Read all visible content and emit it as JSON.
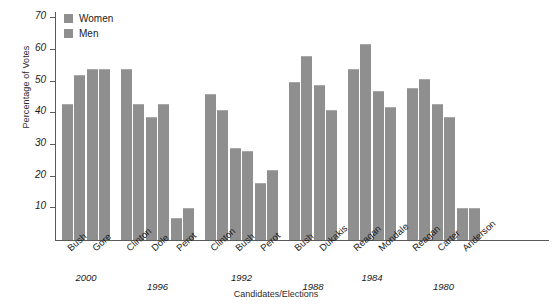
{
  "chart_data": {
    "type": "bar",
    "title": "",
    "xlabel": "Candidates/Elections",
    "ylabel": "Percentage of Votes",
    "ylim": [
      0,
      72
    ],
    "yticks": [
      10,
      20,
      30,
      40,
      50,
      60,
      70
    ],
    "grid": false,
    "legend_position": "top-left",
    "categories": [
      "Bush",
      "Gore",
      "Clinton",
      "Dole",
      "Perot",
      "Clinton",
      "Bush",
      "Perot",
      "Bush",
      "Dukakis",
      "Reagan",
      "Mondale",
      "Reagan",
      "Carter",
      "Anderson"
    ],
    "groups": [
      {
        "year": "2000",
        "candidates": [
          "Bush",
          "Gore"
        ]
      },
      {
        "year": "1996",
        "candidates": [
          "Clinton",
          "Dole",
          "Perot"
        ]
      },
      {
        "year": "1992",
        "candidates": [
          "Clinton",
          "Bush",
          "Perot"
        ]
      },
      {
        "year": "1988",
        "candidates": [
          "Bush",
          "Dukakis"
        ]
      },
      {
        "year": "1984",
        "candidates": [
          "Reagan",
          "Mondale"
        ]
      },
      {
        "year": "1980",
        "candidates": [
          "Reagan",
          "Carter",
          "Anderson"
        ]
      }
    ],
    "series": [
      {
        "name": "Women",
        "color": "#8f8f8f",
        "values": [
          43,
          54,
          54,
          39,
          7,
          46,
          29,
          18,
          50,
          49,
          54,
          47,
          48,
          43,
          10
        ]
      },
      {
        "name": "Men",
        "color": "#8f8f8f",
        "values": [
          52,
          54,
          43,
          43,
          10,
          41,
          28,
          22,
          58,
          41,
          62,
          42,
          51,
          39,
          10
        ]
      }
    ]
  },
  "legend": {
    "items": [
      {
        "label": "Women",
        "color": "#8f8f8f"
      },
      {
        "label": "Men",
        "color": "#8f8f8f"
      }
    ]
  },
  "axes": {
    "y_title": "Percentage of Votes",
    "x_title": "Candidates/Elections"
  }
}
